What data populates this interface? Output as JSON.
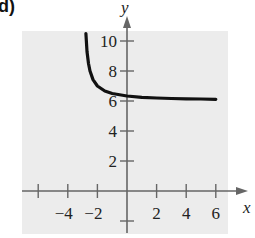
{
  "panel_label": "d)",
  "chart_data": {
    "type": "line",
    "title": "",
    "xlabel": "x",
    "ylabel": "y",
    "xlim": [
      -7,
      7
    ],
    "ylim": [
      -2,
      10.7
    ],
    "x_ticks": [
      -6,
      -4,
      -2,
      2,
      4,
      6
    ],
    "x_tick_labels": [
      "-4",
      "-2",
      "2",
      "4",
      "6"
    ],
    "y_ticks": [
      -2,
      2,
      4,
      6,
      8,
      10
    ],
    "y_tick_labels": [
      "2",
      "4",
      "6",
      "8",
      "10"
    ],
    "grid": false,
    "background": "#ececec",
    "series": [
      {
        "name": "curve",
        "color": "#111111",
        "function_hint": "y = 6 + 1/(x + 3)",
        "vertical_asymptote": -3,
        "horizontal_asymptote": 6,
        "x": [
          -2.78,
          -2.7,
          -2.6,
          -2.5,
          -2.3,
          -2.0,
          -1.5,
          -1.0,
          0,
          1,
          2,
          3,
          4,
          5,
          6
        ],
        "y": [
          10.5,
          9.3,
          8.5,
          8.0,
          7.43,
          7.0,
          6.67,
          6.5,
          6.33,
          6.25,
          6.2,
          6.17,
          6.14,
          6.13,
          6.11
        ]
      }
    ]
  }
}
